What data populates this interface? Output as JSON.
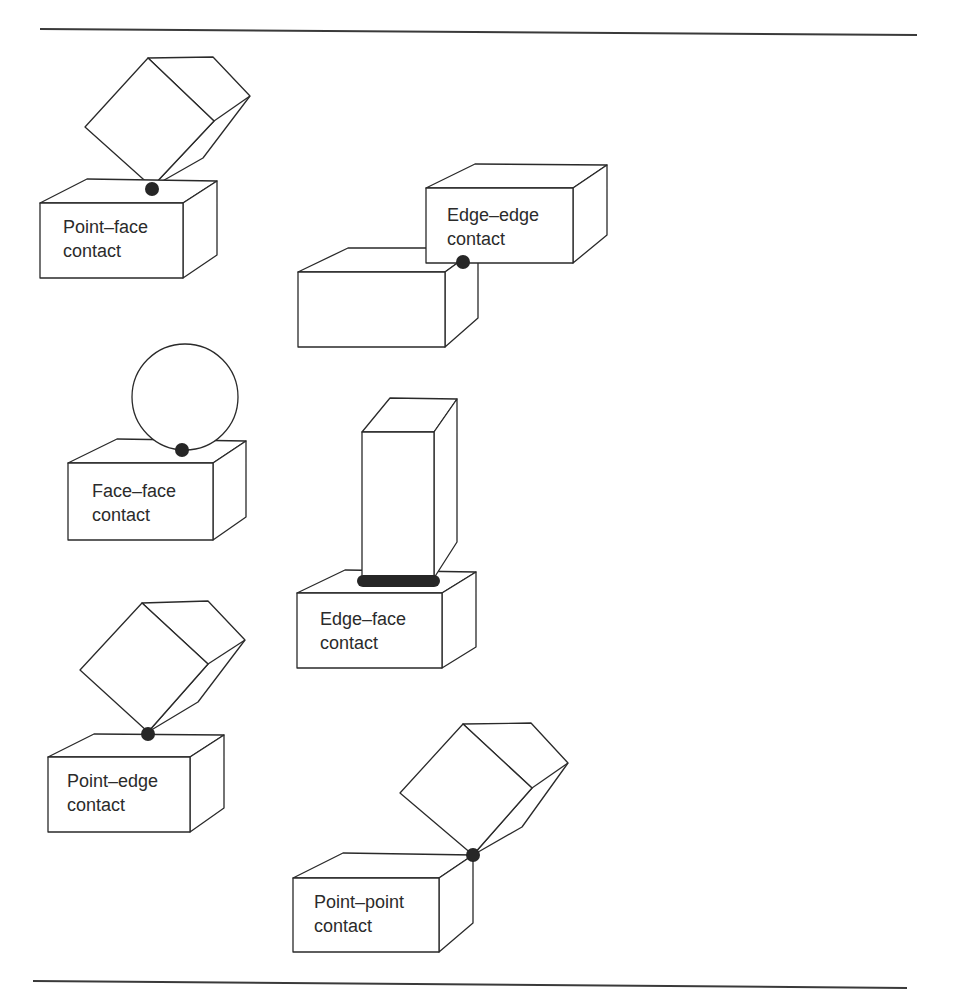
{
  "figure": {
    "rules": [
      {
        "x1": 40,
        "y1": 29,
        "x2": 917,
        "y2": 35
      },
      {
        "x1": 33,
        "y1": 981,
        "x2": 907,
        "y2": 988
      }
    ],
    "colors": {
      "stroke": "#2a2a2a",
      "dot": "#262626",
      "background": "#ffffff"
    },
    "panels": [
      {
        "id": "point-face",
        "label_lines": [
          "Point–face",
          "contact"
        ],
        "label_pos": {
          "x": 63,
          "y1": 233,
          "y2": 257
        },
        "contact_type": "point",
        "contact": {
          "cx": 152,
          "cy": 189,
          "r": 7
        }
      },
      {
        "id": "edge-edge",
        "label_lines": [
          "Edge–edge",
          "contact"
        ],
        "label_pos": {
          "x": 447,
          "y1": 221,
          "y2": 245
        },
        "contact_type": "point",
        "contact": {
          "cx": 463,
          "cy": 262,
          "r": 7
        }
      },
      {
        "id": "face-face",
        "label_lines": [
          "Face–face",
          "contact"
        ],
        "label_pos": {
          "x": 92,
          "y1": 497,
          "y2": 521
        },
        "contact_type": "point",
        "contact": {
          "cx": 182,
          "cy": 450,
          "r": 7
        }
      },
      {
        "id": "edge-face",
        "label_lines": [
          "Edge–face",
          "contact"
        ],
        "label_pos": {
          "x": 320,
          "y1": 625,
          "y2": 649
        },
        "contact_type": "line",
        "contact": {
          "x": 357,
          "y": 575,
          "width": 83,
          "height": 12
        }
      },
      {
        "id": "point-edge",
        "label_lines": [
          "Point–edge",
          "contact"
        ],
        "label_pos": {
          "x": 67,
          "y1": 787,
          "y2": 811
        },
        "contact_type": "point",
        "contact": {
          "cx": 148,
          "cy": 734,
          "r": 7
        }
      },
      {
        "id": "point-point",
        "label_lines": [
          "Point–point",
          "contact"
        ],
        "label_pos": {
          "x": 314,
          "y1": 908,
          "y2": 932
        },
        "contact_type": "point",
        "contact": {
          "cx": 473,
          "cy": 855,
          "r": 7
        }
      }
    ]
  }
}
